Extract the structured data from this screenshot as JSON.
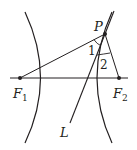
{
  "figure": {
    "type": "hyperbola-foci-diagram",
    "colors": {
      "stroke": "#231f20",
      "background": "#ffffff"
    },
    "labels": {
      "P": "P",
      "F1": "F",
      "F1_sub": "1",
      "F2": "F",
      "F2_sub": "2",
      "L": "L",
      "angle1": "1",
      "angle2": "2"
    },
    "elements": [
      "hyperbola-left-branch",
      "hyperbola-right-branch",
      "x-axis",
      "line-L-through-P",
      "segment-PF1",
      "segment-PF2",
      "angle-1-arc",
      "angle-2-arc"
    ]
  }
}
